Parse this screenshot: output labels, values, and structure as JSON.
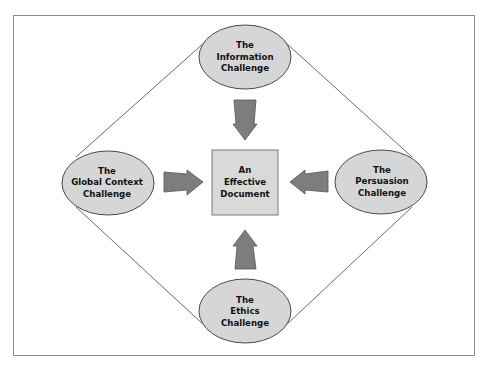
{
  "colors": {
    "frame": "#8a8a8a",
    "ellipse_fill": "#d6d6d6",
    "ellipse_stroke": "#4a4a4a",
    "box_fill": "#d9d9d9",
    "box_stroke": "#7a7a7a",
    "arrow_fill": "#7d7d7d",
    "arrow_stroke": "#555555",
    "line": "#444444"
  },
  "center": {
    "lines": [
      "An",
      "Effective",
      "Document"
    ]
  },
  "nodes": {
    "top": {
      "lines": [
        "The",
        "Information",
        "Challenge"
      ]
    },
    "left": {
      "lines": [
        "The",
        "Global Context",
        "Challenge"
      ]
    },
    "right": {
      "lines": [
        "The",
        "Persuasion",
        "Challenge"
      ]
    },
    "bottom": {
      "lines": [
        "The",
        "Ethics",
        "Challenge"
      ]
    }
  },
  "arrows": [
    {
      "from": "top",
      "to": "center",
      "direction": "down"
    },
    {
      "from": "left",
      "to": "center",
      "direction": "right"
    },
    {
      "from": "right",
      "to": "center",
      "direction": "left"
    },
    {
      "from": "bottom",
      "to": "center",
      "direction": "up"
    }
  ]
}
